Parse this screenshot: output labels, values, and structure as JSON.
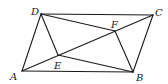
{
  "diagram": {
    "type": "geometry",
    "points": {
      "A": {
        "x": 22,
        "y": 71,
        "label": "A",
        "lx": 10,
        "ly": 80
      },
      "B": {
        "x": 133,
        "y": 72,
        "label": "B",
        "lx": 136,
        "ly": 81
      },
      "C": {
        "x": 153,
        "y": 15,
        "label": "C",
        "lx": 155,
        "ly": 16
      },
      "D": {
        "x": 41,
        "y": 14,
        "label": "D",
        "lx": 31,
        "ly": 15
      },
      "E": {
        "x": 58,
        "y": 55,
        "label": "E",
        "lx": 54,
        "ly": 69
      },
      "F": {
        "x": 115,
        "y": 31,
        "label": "F",
        "lx": 111,
        "ly": 28
      }
    },
    "segments": [
      [
        "A",
        "B"
      ],
      [
        "B",
        "C"
      ],
      [
        "C",
        "D"
      ],
      [
        "D",
        "A"
      ],
      [
        "A",
        "C"
      ],
      [
        "D",
        "E"
      ],
      [
        "D",
        "F"
      ],
      [
        "B",
        "E"
      ],
      [
        "B",
        "F"
      ]
    ]
  }
}
